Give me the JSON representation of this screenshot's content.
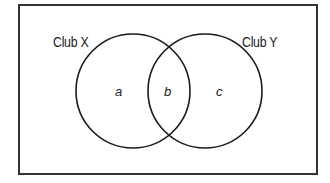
{
  "diagram": {
    "type": "venn",
    "universe": {
      "x": 19,
      "y": 5,
      "width": 298,
      "height": 169,
      "stroke": "#333333"
    },
    "sets": [
      {
        "id": "X",
        "label": "Club X",
        "cx": 133,
        "cy": 91,
        "r": 57,
        "stroke": "#1a1a1a"
      },
      {
        "id": "Y",
        "label": "Club Y",
        "cx": 205,
        "cy": 91,
        "r": 57,
        "stroke": "#1a1a1a"
      }
    ],
    "regions": [
      {
        "id": "a",
        "label": "a",
        "description": "Club X only"
      },
      {
        "id": "b",
        "label": "b",
        "description": "Club X and Club Y"
      },
      {
        "id": "c",
        "label": "c",
        "description": "Club Y only"
      }
    ]
  }
}
